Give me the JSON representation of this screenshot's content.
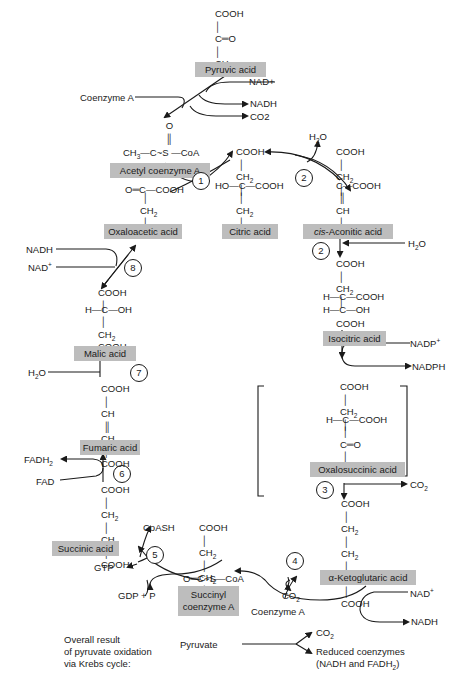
{
  "colors": {
    "label_fill": "#bdbdbd",
    "ink": "#1a1a1a",
    "background": "#ffffff"
  },
  "compounds": {
    "pyruvic_acid": {
      "name": "Pyruvic acid",
      "formula": [
        "COOH",
        "C=O",
        "CH3"
      ]
    },
    "acetyl_coa": {
      "name": "Acetyl coenzyme A",
      "formula": [
        "O",
        "CH3—C~S—CoA"
      ]
    },
    "citric_acid": {
      "name": "Citric acid",
      "formula": [
        "COOH",
        "CH2",
        "HO—C—COOH",
        "CH2",
        "COOH"
      ]
    },
    "cis_aconitic_acid": {
      "name_prefix": "cis",
      "name_rest": "-Aconitic acid",
      "formula": [
        "COOH",
        "CH2",
        "C—COOH",
        "CH",
        "COOH"
      ]
    },
    "isocitric_acid": {
      "name": "Isocitric acid",
      "formula": [
        "COOH",
        "CH2",
        "H—C—COOH",
        "H—C—OH",
        "COOH"
      ]
    },
    "oxalosuccinic_acid": {
      "name": "Oxalosuccinic acid",
      "formula": [
        "COOH",
        "CH2",
        "H—C—COOH",
        "C=O",
        "COOH"
      ]
    },
    "alpha_ketoglutaric_acid": {
      "name": "α-Ketoglutaric acid",
      "formula": [
        "COOH",
        "CH2",
        "CH2",
        "C=O",
        "COOH"
      ]
    },
    "succinyl_coa": {
      "name_line1": "Succinyl",
      "name_line2": "coenzyme A",
      "formula": [
        "COOH",
        "CH2",
        "CH2",
        "O=C~S—CoA"
      ]
    },
    "succinic_acid": {
      "name": "Succinic acid",
      "formula": [
        "COOH",
        "CH2",
        "CH2",
        "COOH"
      ]
    },
    "fumaric_acid": {
      "name": "Fumaric acid",
      "formula": [
        "COOH",
        "CH",
        "CH",
        "COOH"
      ]
    },
    "malic_acid": {
      "name": "Malic acid",
      "formula": [
        "COOH",
        "H—C—OH",
        "CH2",
        "COOH"
      ]
    },
    "oxaloacetic_acid": {
      "name": "Oxaloacetic acid",
      "formula": [
        "O=C—COOH",
        "CH2",
        "COOH"
      ]
    }
  },
  "cofactors": {
    "pyruvate_nad": "NAD+",
    "pyruvate_nadh": "NADH",
    "pyruvate_co2": "CO2",
    "pyruvate_coa": "Coenzyme A",
    "step2_h2o_out": "H2O",
    "step2_h2o_in": "H2O",
    "isocitric_nadp": "NADP+",
    "isocitric_nadph": "NADPH",
    "step3_co2": "CO2",
    "step4_nad": "NAD+",
    "step4_nadh": "NADH",
    "step4_co2": "CO2",
    "step4_coa": "Coenzyme A",
    "step5_coash": "CoASH",
    "step5_gtp": "GTP",
    "step5_gdp": "GDP + P",
    "step6_fadh2": "FADH2",
    "step6_fad": "FAD",
    "step7_h2o": "H2O",
    "step8_nadh": "NADH",
    "step8_nad": "NAD+"
  },
  "steps": [
    "1",
    "2",
    "2",
    "3",
    "4",
    "5",
    "6",
    "7",
    "8"
  ],
  "summary": {
    "heading_lines": [
      "Overall result",
      "of pyruvate oxidation",
      "via Krebs cycle:"
    ],
    "input": "Pyruvate",
    "output_1": "CO2",
    "output_2_line1": "Reduced coenzymes",
    "output_2_line2": "(NADH and FADH2)"
  }
}
